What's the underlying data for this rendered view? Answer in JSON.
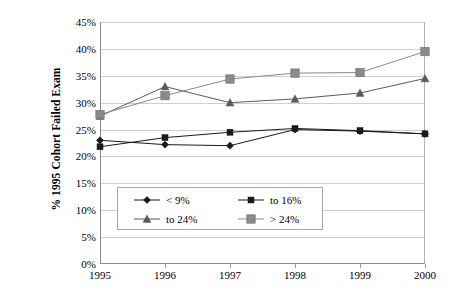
{
  "chart_data": {
    "type": "line",
    "title": "",
    "subtitle": "",
    "xlabel": "",
    "ylabel": "% 1995 Cohort Failed Exam",
    "x": [
      1995,
      1996,
      1997,
      1998,
      1999,
      2000
    ],
    "categories": [
      "1995",
      "1996",
      "1997",
      "1998",
      "1999",
      "2000"
    ],
    "xtick_labels": [
      "1995",
      "1996",
      "1997",
      "1998",
      "1999",
      "2000"
    ],
    "ytick_labels": [
      "0%",
      "5%",
      "10%",
      "15%",
      "20%",
      "25%",
      "30%",
      "35%",
      "40%",
      "45%"
    ],
    "ytick_values": [
      0,
      5,
      10,
      15,
      20,
      25,
      30,
      35,
      40,
      45
    ],
    "ylim": [
      0,
      45
    ],
    "y_units": "percent",
    "grid": "horizontal",
    "legend_position": "inside-lower-left",
    "series": [
      {
        "name": "< 9%",
        "marker": "diamond",
        "color": "#1a1a1a",
        "values": [
          23.0,
          22.2,
          22.0,
          25.0,
          24.7,
          24.2
        ]
      },
      {
        "name": "to 16%",
        "marker": "square",
        "color": "#1a1a1a",
        "values": [
          21.8,
          23.5,
          24.5,
          25.2,
          24.8,
          24.2
        ]
      },
      {
        "name": "to 24%",
        "marker": "triangle",
        "color": "#5a5a5a",
        "values": [
          27.5,
          33.0,
          30.0,
          30.7,
          31.8,
          34.5
        ]
      },
      {
        "name": "> 24%",
        "marker": "square-large",
        "color": "#8a8a8a",
        "values": [
          27.8,
          31.3,
          34.4,
          35.5,
          35.6,
          39.5
        ]
      }
    ]
  },
  "axis": {
    "y_title": "% 1995 Cohort Failed Exam"
  },
  "legend": {
    "items": [
      {
        "label": "< 9%"
      },
      {
        "label": "to 16%"
      },
      {
        "label": "to 24%"
      },
      {
        "label": "> 24%"
      }
    ]
  }
}
